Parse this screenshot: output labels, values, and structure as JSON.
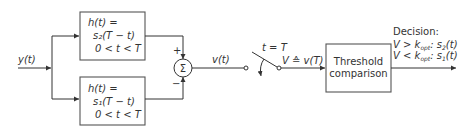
{
  "input": {
    "label": "y(t)"
  },
  "filters": [
    {
      "line1": "h(t) =",
      "line2": "s₂(T − t)",
      "line3": "0 < t < T",
      "sign": "+"
    },
    {
      "line1": "h(t) =",
      "line2": "s₁(T − t)",
      "line3": "0 < t < T",
      "sign": "−"
    }
  ],
  "summer": {
    "symbol": "Σ"
  },
  "sum_output": {
    "label": "v(t)"
  },
  "switch": {
    "label": "t = T",
    "output_label": "V ≙ v(T)"
  },
  "threshold": {
    "line1": "Threshold",
    "line2": "comparison"
  },
  "decision": {
    "title": "Decision:",
    "rule1": "V > k_opt: s₂(t)",
    "rule2": "V < k_opt: s₁(t)"
  }
}
